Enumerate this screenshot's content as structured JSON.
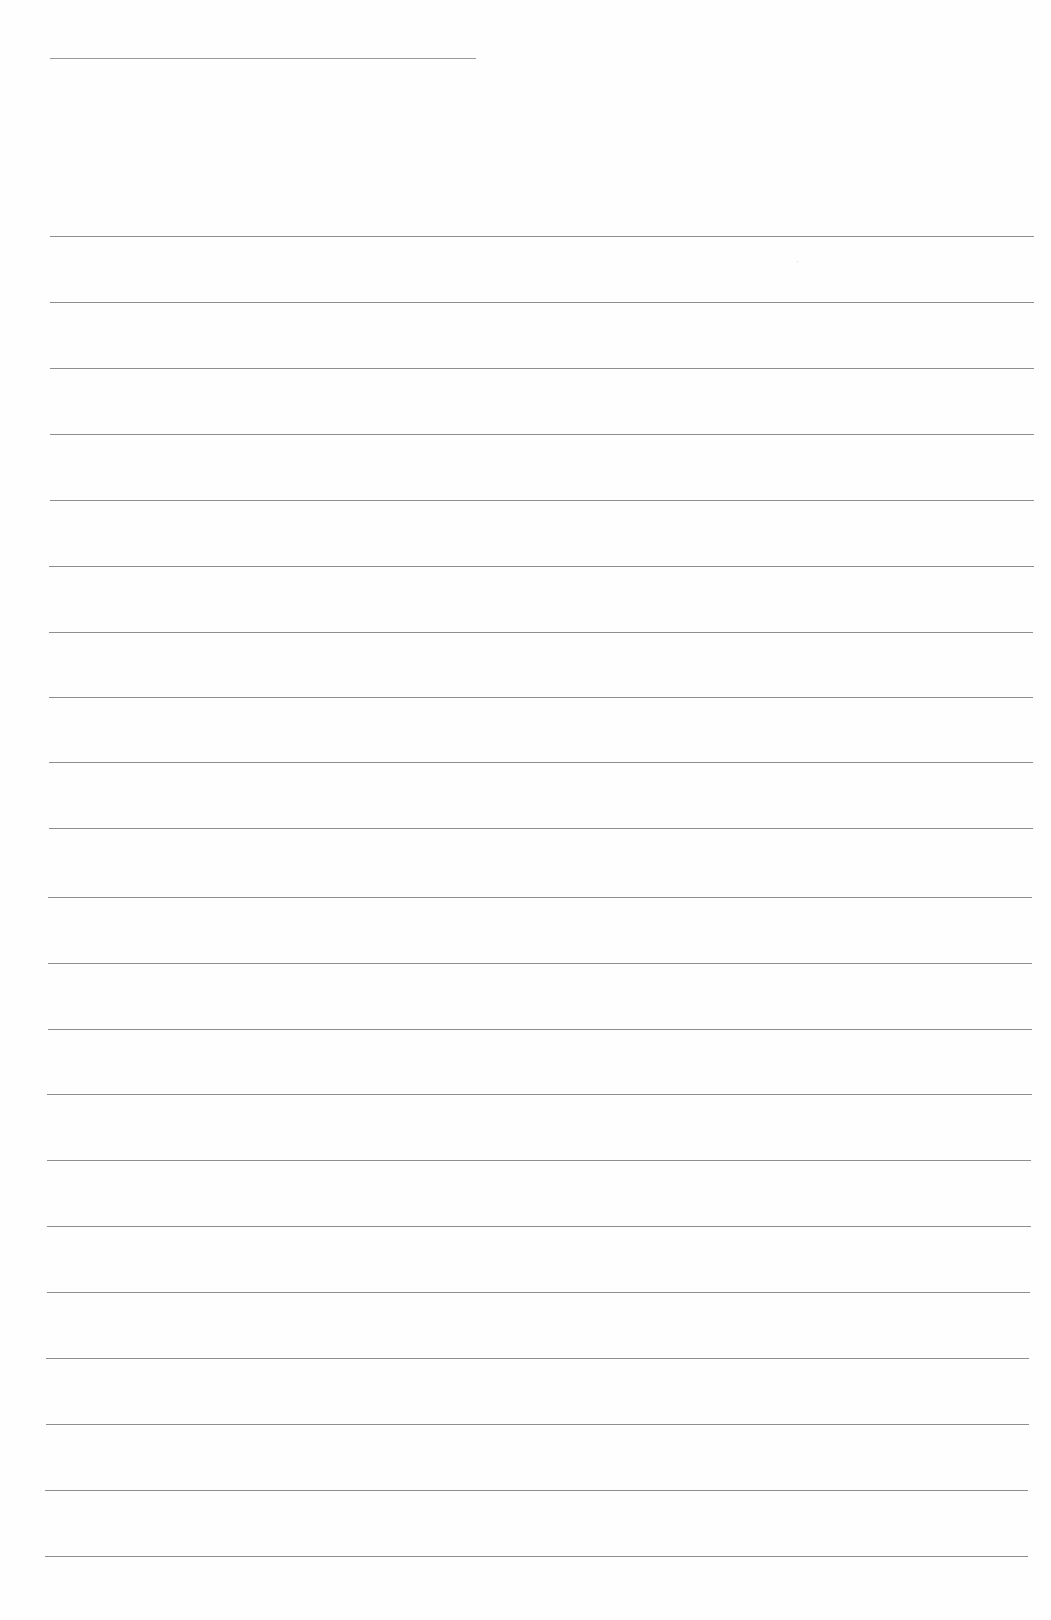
{
  "page": {
    "type": "blank lined paper",
    "background_color": "#fefefe",
    "line_color": "#8e8e8e"
  },
  "title_line": {
    "x": 50,
    "y": 58,
    "width": 426
  },
  "rules": [
    {
      "y": 236,
      "x1": 50,
      "x2": 1034
    },
    {
      "y": 302,
      "x1": 50,
      "x2": 1034
    },
    {
      "y": 368,
      "x1": 50,
      "x2": 1034
    },
    {
      "y": 434,
      "x1": 50,
      "x2": 1034
    },
    {
      "y": 500,
      "x1": 50,
      "x2": 1034
    },
    {
      "y": 566,
      "x1": 49,
      "x2": 1034
    },
    {
      "y": 632,
      "x1": 49,
      "x2": 1033
    },
    {
      "y": 697,
      "x1": 49,
      "x2": 1033
    },
    {
      "y": 762,
      "x1": 49,
      "x2": 1033
    },
    {
      "y": 828,
      "x1": 49,
      "x2": 1033
    },
    {
      "y": 897,
      "x1": 48,
      "x2": 1032
    },
    {
      "y": 963,
      "x1": 48,
      "x2": 1032
    },
    {
      "y": 1029,
      "x1": 48,
      "x2": 1032
    },
    {
      "y": 1094,
      "x1": 47,
      "x2": 1032
    },
    {
      "y": 1160,
      "x1": 47,
      "x2": 1031
    },
    {
      "y": 1226,
      "x1": 47,
      "x2": 1031
    },
    {
      "y": 1292,
      "x1": 47,
      "x2": 1030
    },
    {
      "y": 1358,
      "x1": 46,
      "x2": 1029
    },
    {
      "y": 1424,
      "x1": 46,
      "x2": 1029
    },
    {
      "y": 1490,
      "x1": 45,
      "x2": 1028
    },
    {
      "y": 1556,
      "x1": 45,
      "x2": 1028
    }
  ]
}
